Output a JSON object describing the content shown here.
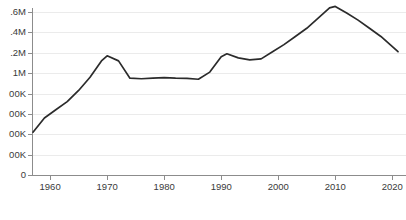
{
  "chart_data": {
    "type": "line",
    "title": "",
    "subtitle": "",
    "xlabel": "",
    "ylabel": "",
    "grid": true,
    "legend": "none",
    "xlim": [
      1957,
      2021
    ],
    "ylim": [
      0,
      1600000
    ],
    "x_tick_labels": [
      "1960",
      "1970",
      "1980",
      "1990",
      "2000",
      "2010",
      "2020"
    ],
    "x_ticks": [
      1960,
      1970,
      1980,
      1990,
      2000,
      2010,
      2020
    ],
    "y_ticks": [
      0,
      200000,
      400000,
      600000,
      800000,
      1000000,
      1200000,
      1400000,
      1600000
    ],
    "y_tick_labels": [
      "0",
      "200K",
      "400K",
      "600K",
      "800K",
      "1M",
      "1.2M",
      "1.4M",
      "1.6M"
    ],
    "y_tick_labels_rendered": [
      "0",
      "00K",
      "00K",
      "00K",
      "00K",
      "1M",
      ".2M",
      ".4M",
      ".6M"
    ],
    "y_axis_labels_clipped_left": true,
    "series": [
      {
        "name": "series-1",
        "color": "#2b2b2b",
        "x": [
          1957,
          1959,
          1961,
          1963,
          1965,
          1967,
          1969,
          1970,
          1972,
          1974,
          1976,
          1978,
          1980,
          1982,
          1984,
          1986,
          1988,
          1990,
          1991,
          1993,
          1995,
          1997,
          1999,
          2001,
          2003,
          2005,
          2007,
          2009,
          2010,
          2012,
          2014,
          2016,
          2018,
          2021
        ],
        "values": [
          420000,
          560000,
          640000,
          720000,
          830000,
          960000,
          1120000,
          1170000,
          1120000,
          950000,
          945000,
          950000,
          955000,
          950000,
          948000,
          940000,
          1010000,
          1160000,
          1190000,
          1150000,
          1130000,
          1140000,
          1210000,
          1280000,
          1360000,
          1440000,
          1540000,
          1640000,
          1655000,
          1590000,
          1520000,
          1440000,
          1360000,
          1210000
        ]
      }
    ]
  }
}
